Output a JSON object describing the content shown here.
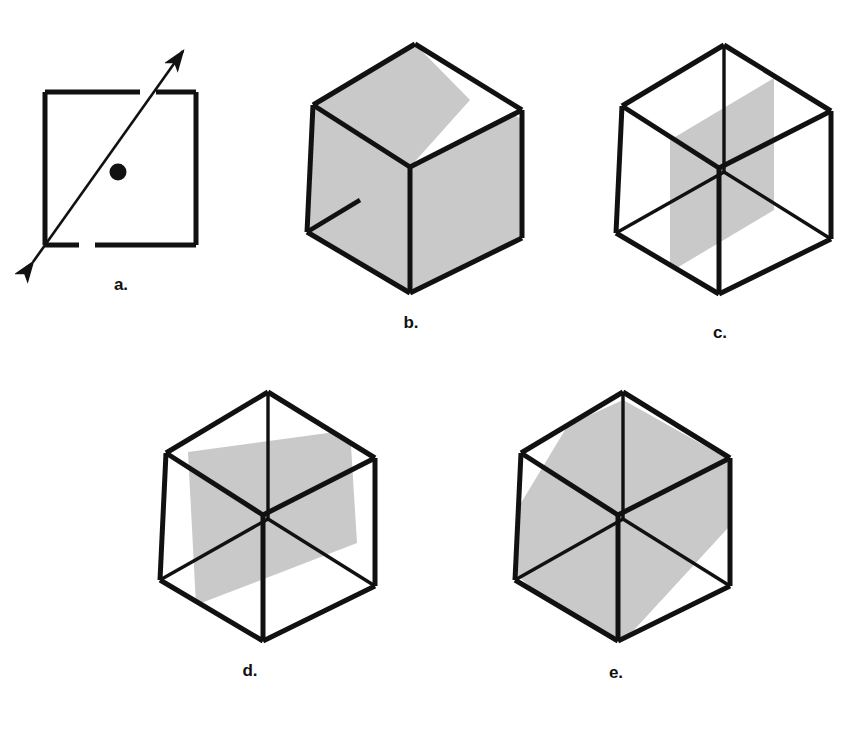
{
  "figure": {
    "background_color": "#ffffff",
    "line_color": "#111111",
    "shade_color": "#c9c9c9",
    "shade_edge_color": "#c9c9c9"
  },
  "panels": [
    {
      "id": "a",
      "caption": "a.",
      "description": "square with double-headed axis arrow through its center and a center dot",
      "shapes": {
        "square": {
          "x": 45,
          "y": 92,
          "width": 151,
          "height": 153
        },
        "axis_arrow": {
          "x1": 30,
          "y1": 266,
          "x2": 186,
          "y2": 47,
          "double_headed": true
        },
        "center_dot": {
          "cx": 118,
          "cy": 172,
          "r": 8
        }
      }
    },
    {
      "id": "b",
      "caption": "b.",
      "description": "cube with a shaded diagonal plane slicing from the top-left top edge down to the bottom-front",
      "cross_section": "diagonal rectangle"
    },
    {
      "id": "c",
      "caption": "c.",
      "description": "wireframe cube with a shaded vertical rectangular plane through the middle",
      "cross_section": "vertical rectangle"
    },
    {
      "id": "d",
      "caption": "d.",
      "description": "wireframe cube with a shaded tilted plane through the middle",
      "cross_section": "tilted rectangle"
    },
    {
      "id": "e",
      "caption": "e.",
      "description": "wireframe cube with a shaded hexagonal cross section through six edge midpoints",
      "cross_section": "hexagon"
    }
  ]
}
